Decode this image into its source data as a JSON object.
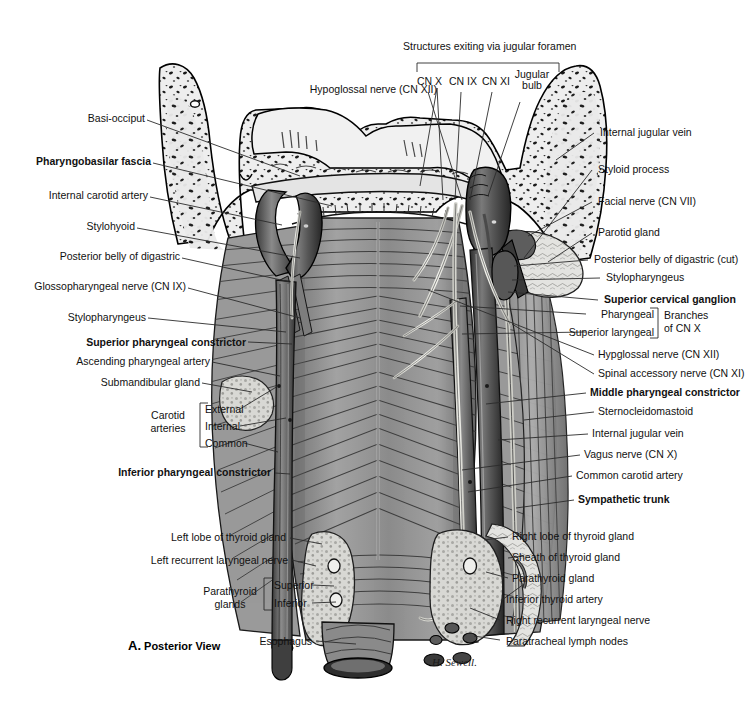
{
  "figure": {
    "caption_letter": "A.",
    "caption_text": "Posterior View",
    "artist_signature": "H. Sewell.",
    "view_title": "Structures exiting via jugular foramen"
  },
  "colors": {
    "ink": "#111111",
    "leader": "#2b2b2b",
    "bone_fill": "#efefef",
    "muscle_mid": "#8e8e8e",
    "muscle_dark": "#5a5a5a",
    "vessel_dark": "#4a4a4a",
    "nerve_light": "#e8e8e2",
    "gland_fill": "#d5d5d2",
    "background": "#ffffff"
  },
  "top_group": {
    "title": "Structures exiting via jugular foramen",
    "items": [
      {
        "label": "CN X"
      },
      {
        "label": "CN IX"
      },
      {
        "label": "CN XI"
      },
      {
        "label": "Jugular bulb"
      }
    ]
  },
  "labels_top": [
    {
      "name": "hypoglossal-nerve",
      "text": "Hypoglossal nerve (CN XII)",
      "bold": false
    }
  ],
  "labels_left": [
    {
      "name": "basi-occiput",
      "text": "Basi-occiput",
      "bold": false
    },
    {
      "name": "pharyngobasilar-fascia",
      "text": "Pharyngobasilar fascia",
      "bold": true
    },
    {
      "name": "internal-carotid-artery",
      "text": "Internal carotid artery",
      "bold": false
    },
    {
      "name": "stylohyoid",
      "text": "Stylohyoid",
      "bold": false
    },
    {
      "name": "posterior-belly-of-digastric",
      "text": "Posterior belly of digastric",
      "bold": false
    },
    {
      "name": "glossopharyngeal-nerve",
      "text": "Glossopharyngeal nerve (CN IX)",
      "bold": false
    },
    {
      "name": "stylopharyngeus-left",
      "text": "Stylopharyngeus",
      "bold": false
    },
    {
      "name": "superior-pharyngeal-constrictor",
      "text": "Superior pharyngeal constrictor",
      "bold": true
    },
    {
      "name": "ascending-pharyngeal-artery",
      "text": "Ascending pharyngeal artery",
      "bold": false
    },
    {
      "name": "submandibular-gland",
      "text": "Submandibular gland",
      "bold": false
    },
    {
      "name": "inferior-pharyngeal-constrictor",
      "text": "Inferior pharyngeal constrictor",
      "bold": true
    }
  ],
  "carotid_group": {
    "group_line1": "Carotid",
    "group_line2": "arteries",
    "items": [
      {
        "label": "External"
      },
      {
        "label": "Internal"
      },
      {
        "label": "Common"
      }
    ]
  },
  "labels_left_lower": [
    {
      "name": "left-lobe-of-thyroid-gland",
      "text": "Left lobe of thyroid gland",
      "bold": false
    },
    {
      "name": "left-recurrent-laryngeal-nerve",
      "text": "Left recurrent laryngeal nerve",
      "bold": false
    },
    {
      "name": "esophagus",
      "text": "Esophagus",
      "bold": false
    }
  ],
  "parathyroid_group": {
    "group_line1": "Parathyroid",
    "group_line2": "glands",
    "items": [
      {
        "label": "Superior"
      },
      {
        "label": "Inferior"
      }
    ]
  },
  "labels_right": [
    {
      "name": "internal-jugular-vein-upper",
      "text": "Internal jugular vein",
      "bold": false
    },
    {
      "name": "styloid-process",
      "text": "Styloid process",
      "bold": false
    },
    {
      "name": "facial-nerve",
      "text": "Facial nerve (CN VII)",
      "bold": false
    },
    {
      "name": "parotid-gland",
      "text": "Parotid gland",
      "bold": false
    },
    {
      "name": "posterior-belly-of-digastric-cut",
      "text": "Posterior belly of digastric (cut)",
      "bold": false
    },
    {
      "name": "stylopharyngeus-right",
      "text": "Stylopharyngeus",
      "bold": false
    },
    {
      "name": "superior-cervical-ganglion",
      "text": "Superior cervical ganglion",
      "bold": true
    }
  ],
  "cnx_branches_group": {
    "items": [
      {
        "label": "Pharyngeal"
      },
      {
        "label": "Superior laryngeal"
      }
    ],
    "group_line1": "Branches",
    "group_line2": "of CN X"
  },
  "labels_right_mid": [
    {
      "name": "hypoglossal-nerve-right",
      "text": "Hypglossal nerve (CN XII)",
      "bold": false
    },
    {
      "name": "spinal-accessory-nerve",
      "text": "Spinal accessory nerve (CN XI)",
      "bold": false
    },
    {
      "name": "middle-pharyngeal-constrictor",
      "text": "Middle pharyngeal constrictor",
      "bold": true
    },
    {
      "name": "sternocleidomastoid",
      "text": "Sternocleidomastoid",
      "bold": false
    },
    {
      "name": "internal-jugular-vein-lower",
      "text": "Internal jugular vein",
      "bold": false
    },
    {
      "name": "vagus-nerve",
      "text": "Vagus nerve (CN X)",
      "bold": false
    },
    {
      "name": "common-carotid-artery",
      "text": "Common carotid artery",
      "bold": false
    },
    {
      "name": "sympathetic-trunk",
      "text": "Sympathetic trunk",
      "bold": true
    }
  ],
  "labels_right_lower": [
    {
      "name": "right-lobe-of-thyroid-gland",
      "text": "Right lobe of thyroid gland",
      "bold": false
    },
    {
      "name": "sheath-of-thyroid-gland",
      "text": "Sheath of thyroid gland",
      "bold": false
    },
    {
      "name": "parathyroid-gland",
      "text": "Parathyroid gland",
      "bold": false
    },
    {
      "name": "inferior-thyroid-artery",
      "text": "Inferior thyroid artery",
      "bold": false
    },
    {
      "name": "right-recurrent-laryngeal-nerve",
      "text": "Right recurrent laryngeal nerve",
      "bold": false
    },
    {
      "name": "paratracheal-lymph-nodes",
      "text": "Paratracheal lymph nodes",
      "bold": false
    }
  ]
}
